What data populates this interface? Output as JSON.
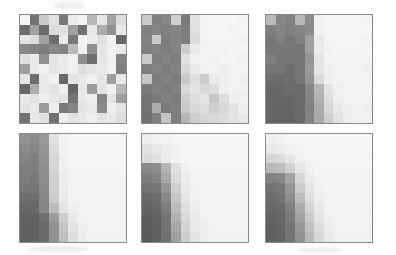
{
  "figure": {
    "caption": "",
    "background_color": "#fdfdfc",
    "panel_border_color": "#8a8a8a",
    "rows": 2,
    "columns": 3,
    "grid_rows": 11,
    "grid_cols": 11,
    "colormap": "grayscale"
  },
  "chart_data": {
    "type": "heatmap",
    "title": "",
    "subtitle": "",
    "xlabel": "",
    "ylabel": "",
    "grid": false,
    "legend_position": "none",
    "colormap": "grays",
    "value_range": [
      0,
      1
    ],
    "panels": [
      {
        "index": 1,
        "name": "panel-1",
        "label": "",
        "position": {
          "row": 1,
          "col": 1
        },
        "rows": 11,
        "cols": 11,
        "values": [
          [
            0.96,
            0.42,
            0.78,
            0.88,
            0.45,
            0.92,
            0.95,
            0.7,
            0.9,
            0.62,
            0.86
          ],
          [
            0.4,
            0.62,
            0.4,
            0.86,
            0.88,
            0.62,
            0.42,
            0.9,
            0.66,
            0.55,
            0.92
          ],
          [
            0.9,
            0.86,
            0.62,
            0.4,
            0.92,
            0.45,
            0.95,
            0.92,
            0.88,
            0.95,
            0.38
          ],
          [
            0.52,
            0.5,
            0.48,
            0.52,
            0.5,
            0.72,
            0.95,
            0.55,
            0.9,
            0.95,
            0.92
          ],
          [
            0.88,
            0.92,
            0.55,
            0.9,
            0.92,
            0.95,
            0.55,
            0.42,
            0.9,
            0.95,
            0.5
          ],
          [
            0.62,
            0.92,
            0.95,
            0.9,
            0.92,
            0.95,
            0.88,
            0.9,
            0.92,
            0.95,
            0.48
          ],
          [
            0.9,
            0.42,
            0.92,
            0.95,
            0.4,
            0.9,
            0.92,
            0.95,
            0.9,
            0.62,
            0.92
          ],
          [
            0.4,
            0.68,
            0.92,
            0.9,
            0.95,
            0.4,
            0.92,
            0.62,
            0.9,
            0.95,
            0.72
          ],
          [
            0.92,
            0.9,
            0.95,
            0.92,
            0.9,
            0.45,
            0.92,
            0.95,
            0.52,
            0.9,
            0.62
          ],
          [
            0.9,
            0.92,
            0.62,
            0.95,
            0.48,
            0.52,
            0.9,
            0.92,
            0.55,
            0.95,
            0.9
          ],
          [
            0.45,
            0.92,
            0.9,
            0.45,
            0.95,
            0.9,
            0.92,
            0.95,
            0.9,
            0.92,
            0.88
          ]
        ]
      },
      {
        "index": 2,
        "name": "panel-2",
        "label": "",
        "position": {
          "row": 1,
          "col": 2
        },
        "rows": 11,
        "cols": 11,
        "values": [
          [
            0.78,
            0.48,
            0.5,
            0.8,
            0.45,
            0.88,
            0.95,
            0.96,
            0.96,
            0.96,
            0.95
          ],
          [
            0.48,
            0.5,
            0.48,
            0.5,
            0.48,
            0.88,
            0.95,
            0.96,
            0.96,
            0.95,
            0.96
          ],
          [
            0.5,
            0.78,
            0.48,
            0.5,
            0.48,
            0.86,
            0.95,
            0.96,
            0.96,
            0.96,
            0.95
          ],
          [
            0.48,
            0.5,
            0.48,
            0.5,
            0.8,
            0.92,
            0.95,
            0.96,
            0.95,
            0.96,
            0.96
          ],
          [
            0.78,
            0.48,
            0.5,
            0.48,
            0.88,
            0.95,
            0.96,
            0.95,
            0.96,
            0.96,
            0.95
          ],
          [
            0.48,
            0.5,
            0.48,
            0.5,
            0.85,
            0.92,
            0.95,
            0.96,
            0.95,
            0.96,
            0.96
          ],
          [
            0.78,
            0.48,
            0.5,
            0.48,
            0.8,
            0.88,
            0.8,
            0.92,
            0.95,
            0.96,
            0.95
          ],
          [
            0.48,
            0.5,
            0.48,
            0.5,
            0.86,
            0.9,
            0.86,
            0.88,
            0.95,
            0.96,
            0.96
          ],
          [
            0.45,
            0.48,
            0.5,
            0.48,
            0.82,
            0.88,
            0.9,
            0.78,
            0.88,
            0.95,
            0.95
          ],
          [
            0.45,
            0.68,
            0.48,
            0.5,
            0.8,
            0.86,
            0.88,
            0.82,
            0.86,
            0.9,
            0.95
          ],
          [
            0.45,
            0.5,
            0.78,
            0.5,
            0.72,
            0.82,
            0.85,
            0.86,
            0.88,
            0.9,
            0.92
          ]
        ]
      },
      {
        "index": 3,
        "name": "panel-3",
        "label": "",
        "position": {
          "row": 1,
          "col": 3
        },
        "rows": 11,
        "cols": 11,
        "values": [
          [
            0.72,
            0.5,
            0.48,
            0.7,
            0.52,
            0.95,
            0.96,
            0.96,
            0.96,
            0.96,
            0.95
          ],
          [
            0.48,
            0.5,
            0.48,
            0.5,
            0.52,
            0.95,
            0.96,
            0.96,
            0.96,
            0.96,
            0.96
          ],
          [
            0.45,
            0.48,
            0.45,
            0.48,
            0.62,
            0.92,
            0.96,
            0.96,
            0.96,
            0.96,
            0.95
          ],
          [
            0.45,
            0.45,
            0.45,
            0.45,
            0.62,
            0.92,
            0.95,
            0.96,
            0.96,
            0.96,
            0.96
          ],
          [
            0.48,
            0.45,
            0.45,
            0.45,
            0.58,
            0.9,
            0.96,
            0.96,
            0.96,
            0.96,
            0.96
          ],
          [
            0.45,
            0.45,
            0.42,
            0.45,
            0.6,
            0.9,
            0.95,
            0.96,
            0.96,
            0.96,
            0.95
          ],
          [
            0.42,
            0.42,
            0.42,
            0.45,
            0.58,
            0.86,
            0.95,
            0.96,
            0.96,
            0.96,
            0.96
          ],
          [
            0.4,
            0.4,
            0.42,
            0.42,
            0.52,
            0.72,
            0.9,
            0.95,
            0.96,
            0.96,
            0.96
          ],
          [
            0.4,
            0.4,
            0.4,
            0.42,
            0.52,
            0.7,
            0.88,
            0.95,
            0.96,
            0.96,
            0.96
          ],
          [
            0.4,
            0.4,
            0.4,
            0.42,
            0.5,
            0.68,
            0.86,
            0.92,
            0.95,
            0.96,
            0.95
          ],
          [
            0.4,
            0.4,
            0.4,
            0.42,
            0.52,
            0.68,
            0.82,
            0.9,
            0.95,
            0.96,
            0.96
          ]
        ]
      },
      {
        "index": 4,
        "name": "panel-4",
        "label": "",
        "position": {
          "row": 2,
          "col": 1
        },
        "rows": 11,
        "cols": 11,
        "values": [
          [
            0.55,
            0.52,
            0.58,
            0.88,
            0.95,
            0.96,
            0.96,
            0.96,
            0.96,
            0.96,
            0.96
          ],
          [
            0.52,
            0.5,
            0.56,
            0.86,
            0.95,
            0.96,
            0.96,
            0.96,
            0.96,
            0.96,
            0.96
          ],
          [
            0.5,
            0.48,
            0.55,
            0.84,
            0.94,
            0.96,
            0.96,
            0.96,
            0.96,
            0.96,
            0.96
          ],
          [
            0.48,
            0.48,
            0.54,
            0.84,
            0.94,
            0.96,
            0.96,
            0.96,
            0.96,
            0.96,
            0.96
          ],
          [
            0.48,
            0.46,
            0.54,
            0.82,
            0.93,
            0.96,
            0.96,
            0.96,
            0.96,
            0.96,
            0.96
          ],
          [
            0.46,
            0.45,
            0.53,
            0.82,
            0.93,
            0.96,
            0.96,
            0.96,
            0.96,
            0.96,
            0.96
          ],
          [
            0.42,
            0.42,
            0.52,
            0.8,
            0.92,
            0.96,
            0.96,
            0.96,
            0.96,
            0.96,
            0.96
          ],
          [
            0.4,
            0.4,
            0.52,
            0.74,
            0.9,
            0.95,
            0.96,
            0.96,
            0.96,
            0.96,
            0.96
          ],
          [
            0.38,
            0.38,
            0.44,
            0.62,
            0.82,
            0.93,
            0.96,
            0.96,
            0.96,
            0.96,
            0.96
          ],
          [
            0.38,
            0.38,
            0.42,
            0.58,
            0.78,
            0.9,
            0.95,
            0.96,
            0.96,
            0.96,
            0.96
          ],
          [
            0.38,
            0.38,
            0.42,
            0.58,
            0.76,
            0.88,
            0.94,
            0.96,
            0.96,
            0.96,
            0.96
          ]
        ]
      },
      {
        "index": 5,
        "name": "panel-5",
        "label": "",
        "position": {
          "row": 2,
          "col": 2
        },
        "rows": 11,
        "cols": 11,
        "values": [
          [
            0.93,
            0.94,
            0.95,
            0.96,
            0.96,
            0.96,
            0.96,
            0.96,
            0.96,
            0.96,
            0.96
          ],
          [
            0.88,
            0.9,
            0.93,
            0.95,
            0.96,
            0.96,
            0.96,
            0.96,
            0.96,
            0.96,
            0.96
          ],
          [
            0.86,
            0.88,
            0.92,
            0.95,
            0.96,
            0.96,
            0.96,
            0.96,
            0.96,
            0.96,
            0.96
          ],
          [
            0.52,
            0.54,
            0.7,
            0.88,
            0.94,
            0.96,
            0.96,
            0.96,
            0.96,
            0.96,
            0.96
          ],
          [
            0.48,
            0.5,
            0.66,
            0.86,
            0.93,
            0.96,
            0.96,
            0.96,
            0.96,
            0.96,
            0.96
          ],
          [
            0.44,
            0.45,
            0.58,
            0.82,
            0.92,
            0.95,
            0.96,
            0.96,
            0.96,
            0.96,
            0.96
          ],
          [
            0.4,
            0.42,
            0.52,
            0.78,
            0.9,
            0.95,
            0.96,
            0.96,
            0.96,
            0.96,
            0.96
          ],
          [
            0.38,
            0.4,
            0.48,
            0.74,
            0.88,
            0.94,
            0.96,
            0.96,
            0.96,
            0.96,
            0.96
          ],
          [
            0.36,
            0.38,
            0.46,
            0.7,
            0.86,
            0.93,
            0.96,
            0.96,
            0.96,
            0.96,
            0.96
          ],
          [
            0.36,
            0.38,
            0.45,
            0.66,
            0.84,
            0.92,
            0.95,
            0.96,
            0.96,
            0.96,
            0.96
          ],
          [
            0.36,
            0.38,
            0.45,
            0.64,
            0.82,
            0.9,
            0.95,
            0.96,
            0.96,
            0.96,
            0.96
          ]
        ]
      },
      {
        "index": 6,
        "name": "panel-6",
        "label": "",
        "position": {
          "row": 2,
          "col": 3
        },
        "rows": 11,
        "cols": 11,
        "values": [
          [
            0.94,
            0.95,
            0.96,
            0.96,
            0.96,
            0.96,
            0.96,
            0.96,
            0.96,
            0.96,
            0.96
          ],
          [
            0.9,
            0.92,
            0.94,
            0.95,
            0.96,
            0.96,
            0.96,
            0.96,
            0.96,
            0.96,
            0.96
          ],
          [
            0.84,
            0.86,
            0.9,
            0.94,
            0.96,
            0.96,
            0.96,
            0.96,
            0.96,
            0.96,
            0.96
          ],
          [
            0.72,
            0.74,
            0.82,
            0.9,
            0.95,
            0.96,
            0.96,
            0.96,
            0.96,
            0.96,
            0.96
          ],
          [
            0.5,
            0.52,
            0.64,
            0.84,
            0.93,
            0.96,
            0.96,
            0.96,
            0.96,
            0.96,
            0.96
          ],
          [
            0.44,
            0.46,
            0.58,
            0.8,
            0.9,
            0.95,
            0.96,
            0.96,
            0.96,
            0.96,
            0.96
          ],
          [
            0.42,
            0.44,
            0.54,
            0.74,
            0.88,
            0.94,
            0.96,
            0.96,
            0.96,
            0.96,
            0.96
          ],
          [
            0.4,
            0.42,
            0.5,
            0.68,
            0.84,
            0.92,
            0.96,
            0.96,
            0.96,
            0.96,
            0.96
          ],
          [
            0.38,
            0.4,
            0.48,
            0.64,
            0.8,
            0.9,
            0.95,
            0.96,
            0.96,
            0.96,
            0.96
          ],
          [
            0.38,
            0.4,
            0.46,
            0.6,
            0.76,
            0.88,
            0.94,
            0.96,
            0.96,
            0.96,
            0.96
          ],
          [
            0.38,
            0.4,
            0.46,
            0.58,
            0.74,
            0.86,
            0.93,
            0.96,
            0.96,
            0.96,
            0.96
          ]
        ]
      }
    ]
  }
}
